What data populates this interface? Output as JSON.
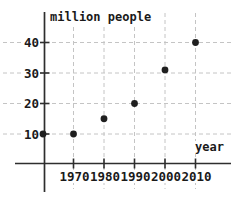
{
  "chart_data": {
    "type": "scatter",
    "title": "million people",
    "xlabel": "year",
    "ylabel": "million people",
    "x": [
      1960,
      1970,
      1980,
      1990,
      2000,
      2010
    ],
    "values": [
      10,
      10,
      15,
      20,
      31,
      40
    ],
    "xticks": [
      1970,
      1980,
      1990,
      2000,
      2010
    ],
    "yticks": [
      10,
      20,
      30,
      40
    ],
    "xlim": [
      1950,
      2012
    ],
    "ylim": [
      0,
      50
    ],
    "grid": true,
    "legend": null,
    "colors": {
      "point": "#1f1f1f",
      "axis": "#2e2e2e",
      "gridline": "#c4c4c4",
      "text": "#1a1a1a",
      "background": "#ffffff"
    }
  }
}
